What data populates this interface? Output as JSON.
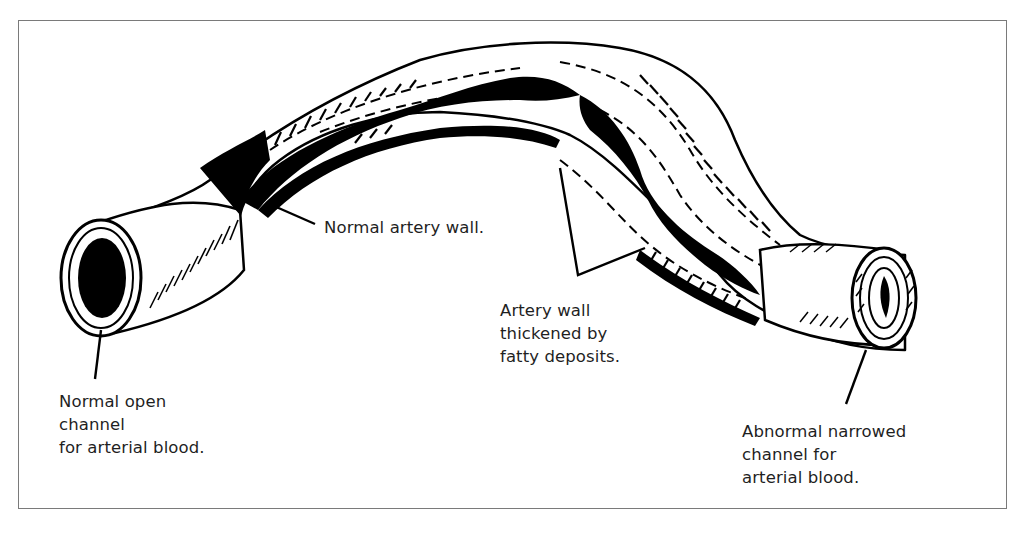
{
  "diagram": {
    "colors": {
      "ink": "#000000",
      "paper": "#ffffff",
      "frame": "#7a7a7a",
      "text": "#1f1f1f"
    },
    "labels": {
      "normal_wall": {
        "lines": [
          "Normal artery wall."
        ]
      },
      "thickened_wall": {
        "lines": [
          "Artery wall",
          "thickened by",
          "fatty deposits."
        ]
      },
      "open_channel": {
        "lines": [
          "Normal open",
          "channel",
          "for arterial blood."
        ]
      },
      "narrowed_channel": {
        "lines": [
          "Abnormal narrowed",
          "channel for",
          "arterial blood."
        ]
      }
    },
    "parts": [
      "left-open-end-vessel",
      "curved-artery-cutaway",
      "normal-lumen",
      "fatty-deposit-plaque",
      "right-narrowed-end-vessel"
    ]
  }
}
